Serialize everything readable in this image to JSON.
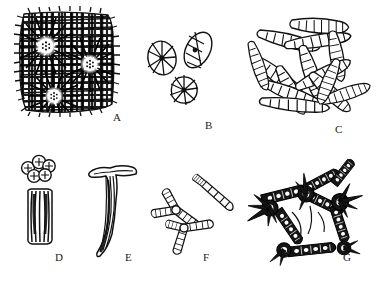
{
  "figure": {
    "kind": "scientific-illustration-plate",
    "medium": "black ink line drawing on white background",
    "background_color": "#ffffff",
    "ink_color": "#1a1a1a",
    "panel_count": 7,
    "width_px": 386,
    "height_px": 283
  },
  "labels": {
    "a": "A",
    "b": "B",
    "c": "C",
    "d": "D",
    "e": "E",
    "f": "F",
    "g": "G"
  },
  "panels": [
    {
      "id": "A",
      "label": "A",
      "row": "top",
      "description": "Dense dark rectangular block of radiating fibrous tissue with three pale rosette centres, each rosette ringed by small dots and surrounded by radiating spicule bundles.",
      "motif": "rosette-bearing-block",
      "rosette_count": 3,
      "fill": "dense dark stipple/hatching",
      "label_pos": {
        "x": 113,
        "y": 118
      }
    },
    {
      "id": "B",
      "label": "B",
      "row": "top",
      "description": "Three isolated rounded to oval sclerites seen in face view, each divided internally into radiating wedge-shaped segments around a dark central point.",
      "motif": "radiating-segmented-discs",
      "element_count": 3,
      "label_pos": {
        "x": 207,
        "y": 127
      }
    },
    {
      "id": "C",
      "label": "C",
      "row": "top",
      "description": "Loose tangle of many elongate rod-shaped (fusiform) spicules, each transversely segmented, crossing one another at varied angles.",
      "motif": "tangled-segmented-rods",
      "element_count": 14,
      "label_pos": {
        "x": 337,
        "y": 130
      }
    },
    {
      "id": "D",
      "label": "D",
      "row": "bottom",
      "description": "Above: a small cluster of five rounded bodies each marked with a cross or star. Below: an elongate vertical capsule-shaped bundle with longitudinal internal striations.",
      "motif": "granule-cluster-and-striated-capsule",
      "granule_count": 5,
      "label_pos": {
        "x": 57,
        "y": 258
      }
    },
    {
      "id": "E",
      "label": "E",
      "row": "bottom",
      "description": "Single large T-shaped anchor spicule: a pair of recurved horizontal arms at the top and a long slender shaft tapering to a point below.",
      "motif": "t-shaped-anchor-spicule",
      "element_count": 1,
      "label_pos": {
        "x": 127,
        "y": 258
      }
    },
    {
      "id": "F",
      "label": "F",
      "row": "bottom",
      "description": "Two branching star-like spicules with three to four segmented rays radiating from a central node, plus one slender segmented rod alongside.",
      "motif": "branching-stellate-spicules",
      "element_count": 3,
      "label_pos": {
        "x": 205,
        "y": 258
      }
    },
    {
      "id": "G",
      "label": "G",
      "row": "bottom",
      "description": "Network of heavy, dark, internally chambered spicules joined into an open mesh, with numerous sharp spines projecting outward from the nodes.",
      "motif": "spiny-anastomosing-network",
      "node_count": 4,
      "label_pos": {
        "x": 345,
        "y": 258
      }
    }
  ]
}
